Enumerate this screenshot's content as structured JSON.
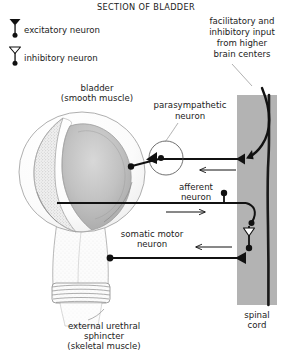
{
  "figure": {
    "title": "SECTION OF BLADDER"
  },
  "legend": {
    "items": [
      {
        "icon": "excitatory-synapse-icon",
        "label": "excitatory  neuron",
        "symbol": "filled-triangle-on-stem"
      },
      {
        "icon": "inhibitory-synapse-icon",
        "label": "inhibitory  neuron",
        "symbol": "open-triangle-on-stem"
      }
    ]
  },
  "labels": {
    "bladder": "bladder",
    "bladder_sub": "(smooth muscle)",
    "parasympathetic": "parasympathetic",
    "parasympathetic_sub": "neuron",
    "afferent": "afferent",
    "afferent_sub": "neuron",
    "somatic": "somatic motor",
    "somatic_sub": "neuron",
    "sphincter_l1": "external urethral",
    "sphincter_l2": "sphincter",
    "sphincter_l3": "(skeletal muscle)",
    "higher_l1": "facilitatory and",
    "higher_l2": "inhibitory input",
    "higher_l3": "from higher",
    "higher_l4": "brain centers",
    "spinal_l1": "spinal",
    "spinal_l2": "cord"
  },
  "colors": {
    "ink": "#1a1a1a",
    "line": "#111111",
    "organ_outline": "#8b8b8b",
    "organ_fill": "#fbfbfb",
    "organ_shade_light": "#e2e2e2",
    "organ_shade_mid": "#c9c9c9",
    "organ_shade_dark": "#b0b0b0",
    "spinal_cord_fill": "#b3b3b3",
    "spinal_cord_tract": "#1a1a1a",
    "background": "#ffffff",
    "leader_line": "#8f8f8f"
  },
  "anatomy": {
    "spinal_cord": {
      "shape": "vertical-gray-band",
      "x": 237,
      "y": 95,
      "width": 40,
      "height": 210,
      "tract_line_x": 268
    },
    "bladder": {
      "shape": "cutaway-sphere-with-urethra",
      "center_x": 82,
      "center_y": 172,
      "radius": 62
    },
    "sphincter": {
      "shape": "striated-band",
      "x": 52,
      "y": 283,
      "width": 58,
      "height": 20,
      "stripes": 5
    }
  },
  "pathways": [
    {
      "name": "parasympathetic-neuron",
      "from": "spinal-cord",
      "to": "bladder-wall",
      "synapse": "excitatory",
      "ganglion": "peripheral-ganglion-circle"
    },
    {
      "name": "afferent-neuron",
      "from": "bladder-wall",
      "to": "spinal-cord",
      "direction": "rightward-arrow"
    },
    {
      "name": "somatic-motor-neuron",
      "from": "spinal-cord",
      "to": "external-urethral-sphincter",
      "direction": "leftward-arrow"
    },
    {
      "name": "descending-input",
      "from": "higher-brain-centers",
      "to": "spinal-cord",
      "synapse": "excitatory"
    },
    {
      "name": "inhibitory-interneuron",
      "location": "spinal-cord",
      "synapse": "inhibitory"
    }
  ]
}
